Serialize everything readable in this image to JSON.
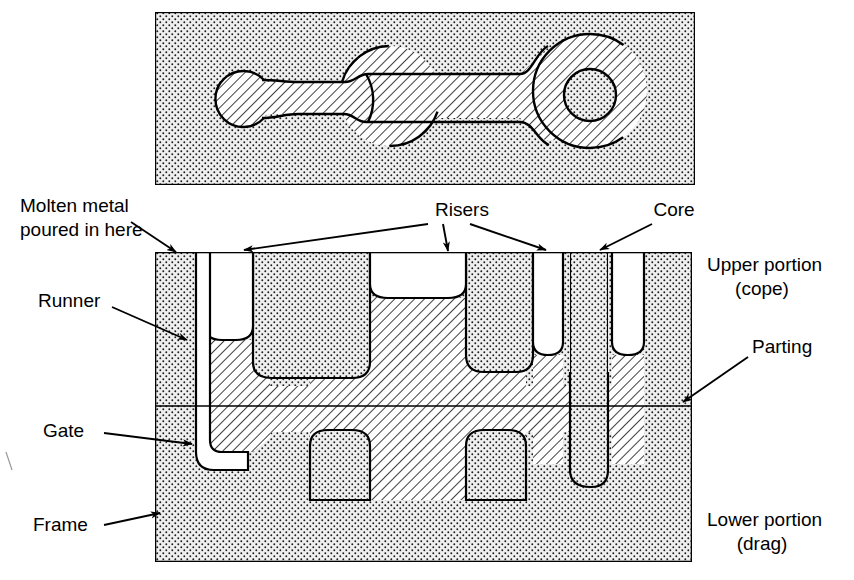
{
  "figure": {
    "colors": {
      "outline": "#000000",
      "sand_fill": "#eeeeee",
      "sand_dot": "#1a1a1a",
      "metal_hatch": "#000000",
      "cavity_fill": "#ffffff",
      "background": "#ffffff"
    }
  },
  "labels": {
    "molten_metal": {
      "line1": "Molten metal",
      "line2": "poured in here"
    },
    "runner": "Runner",
    "gate": "Gate",
    "frame": "Frame",
    "risers": "Risers",
    "core": "Core",
    "parting": "Parting",
    "upper_portion": {
      "line1": "Upper portion",
      "line2": "(cope)"
    },
    "lower_portion": {
      "line1": "Lower portion",
      "line2": "(drag)"
    }
  },
  "top_view": {
    "name": "pattern-top-view",
    "box": {
      "x": 155,
      "y": 12,
      "width": 540,
      "height": 173
    },
    "pattern": {
      "left_boss": {
        "cx": 243,
        "cy": 99,
        "r": 28
      },
      "center_boss": {
        "cx": 390,
        "cy": 96,
        "r": 50
      },
      "right_boss": {
        "cx": 590,
        "cy": 91,
        "r": 57
      },
      "right_hole": {
        "cx": 590,
        "cy": 95,
        "r": 26
      },
      "bar_left": {
        "x1": 243,
        "x2": 390,
        "y_top": 82,
        "y_bottom": 114
      },
      "bar_right": {
        "x1": 390,
        "x2": 590,
        "y_top": 74,
        "y_bottom": 118
      }
    }
  },
  "section_view": {
    "name": "mold-cross-section",
    "box": {
      "x": 155,
      "y": 252,
      "width": 537,
      "height": 310
    },
    "parting_line_y": 406,
    "sprue": {
      "x_left": 176,
      "x_right": 196,
      "top_y": 252
    },
    "risers": [
      {
        "name": "riser-left",
        "x": 205,
        "width": 48,
        "bottom_y": 340
      },
      {
        "name": "riser-center",
        "x": 370,
        "width": 96,
        "bottom_y": 298
      },
      {
        "name": "riser-right",
        "x": 533,
        "width": 30,
        "bottom_y": 355
      },
      {
        "name": "riser-far-right",
        "x": 612,
        "width": 32,
        "bottom_y": 355
      }
    ],
    "core": {
      "name": "core-column",
      "x": 570,
      "width": 38,
      "bottom_y": 487
    }
  },
  "annotations": [
    {
      "name": "molten-metal-arrow",
      "target": "sprue-opening"
    },
    {
      "name": "runner-arrow",
      "target": "runner-channel"
    },
    {
      "name": "gate-arrow",
      "target": "gate-channel"
    },
    {
      "name": "frame-arrow",
      "target": "mold-frame"
    },
    {
      "name": "risers-arrow-1",
      "target": "riser-left"
    },
    {
      "name": "risers-arrow-2",
      "target": "riser-center"
    },
    {
      "name": "risers-arrow-3",
      "target": "riser-far-right"
    },
    {
      "name": "core-arrow",
      "target": "core-column"
    },
    {
      "name": "parting-arrow",
      "target": "parting-line"
    }
  ]
}
